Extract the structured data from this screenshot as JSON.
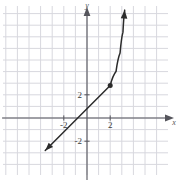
{
  "figure": {
    "kind": "coordinate-plane-graph",
    "width": 178,
    "height": 186,
    "background": "#ffffff",
    "grid_color": "#d8d8de",
    "axis_color": "#55555c",
    "curve_color": "#2b2b2b"
  },
  "axes": {
    "x_label": "x",
    "y_label": "y",
    "x_tick_labels": [
      "-2",
      "2"
    ],
    "y_tick_labels": [
      "2",
      "-2"
    ]
  },
  "chart_data": {
    "type": "line",
    "title": "",
    "xlabel": "x",
    "ylabel": "y",
    "grid": true,
    "legend": false,
    "xlim": [
      -7.5,
      7
    ],
    "ylim": [
      -5,
      10.2
    ],
    "xticks": [
      -2,
      2
    ],
    "yticks": [
      -2,
      2
    ],
    "xtick_labels": [
      "-2",
      "2"
    ],
    "ytick_labels": [
      "2",
      "-2"
    ],
    "annotations": [
      {
        "name": "endpoint-dot",
        "x": 2,
        "y": 2.8,
        "style": "filled-circle"
      }
    ],
    "series": [
      {
        "name": "linear-branch",
        "style": "solid-line-with-arrow-start",
        "arrow_start": true,
        "arrow_end": false,
        "points": [
          {
            "x": -3.6,
            "y": -2.8
          },
          {
            "x": 2.0,
            "y": 2.8
          }
        ]
      },
      {
        "name": "steep-branch",
        "style": "solid-curve-with-arrow-end",
        "arrow_start": false,
        "arrow_end": true,
        "points": [
          {
            "x": 2.0,
            "y": 2.8
          },
          {
            "x": 2.5,
            "y": 4.0
          },
          {
            "x": 2.85,
            "y": 5.6
          },
          {
            "x": 3.1,
            "y": 7.4
          },
          {
            "x": 3.25,
            "y": 9.3
          }
        ]
      }
    ]
  }
}
